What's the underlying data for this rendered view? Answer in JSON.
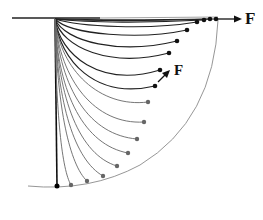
{
  "figure": {
    "labels": {
      "force_top": "F",
      "force_mid": "F"
    },
    "colors": {
      "dark": "#111111",
      "mid": "#444444",
      "light": "#777777",
      "arc": "#888888"
    },
    "origin": [
      55,
      19
    ],
    "baseline": {
      "x1": 12,
      "x2": 218,
      "y": 18
    },
    "vertical_rod": {
      "x": 56,
      "y1": 19,
      "y2": 186
    },
    "boundary_arc": {
      "start": [
        218,
        20
      ],
      "end": [
        28,
        186
      ]
    },
    "endpoints": [
      [
        216,
        19
      ],
      [
        210,
        19
      ],
      [
        204,
        20
      ],
      [
        197,
        22
      ],
      [
        187,
        30
      ],
      [
        177,
        41
      ],
      [
        169,
        53
      ],
      [
        160,
        70
      ],
      [
        155,
        86
      ],
      [
        148,
        102
      ],
      [
        144,
        122
      ],
      [
        137,
        139
      ],
      [
        128,
        153
      ],
      [
        117,
        166
      ],
      [
        103,
        176
      ],
      [
        87,
        181
      ],
      [
        71,
        185
      ],
      [
        57,
        186
      ]
    ]
  }
}
